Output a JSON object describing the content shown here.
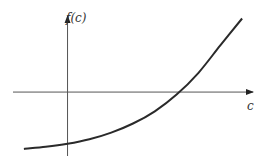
{
  "chart_data": {
    "type": "line",
    "title": "",
    "xlabel": "c",
    "ylabel": "f(c)",
    "grid": false,
    "legend": "none",
    "xlim": [
      -1,
      3.4
    ],
    "ylim": [
      -1.3,
      1.5
    ],
    "series": [
      {
        "name": "f(c)",
        "description": "increasing convex curve crossing the vertical axis below zero and crossing the horizontal axis at a positive root",
        "x": [
          -0.8,
          -0.4,
          0.0,
          0.4,
          0.8,
          1.2,
          1.6,
          2.0,
          2.4,
          2.8,
          3.2
        ],
        "y": [
          -1.12,
          -1.08,
          -1.02,
          -0.93,
          -0.8,
          -0.62,
          -0.38,
          -0.05,
          0.38,
          0.92,
          1.45
        ]
      }
    ],
    "annotations": []
  },
  "labels": {
    "y_axis": "f(c)",
    "x_axis": "c"
  },
  "colors": {
    "curve": "#2a2a2a",
    "axis": "#555555"
  }
}
